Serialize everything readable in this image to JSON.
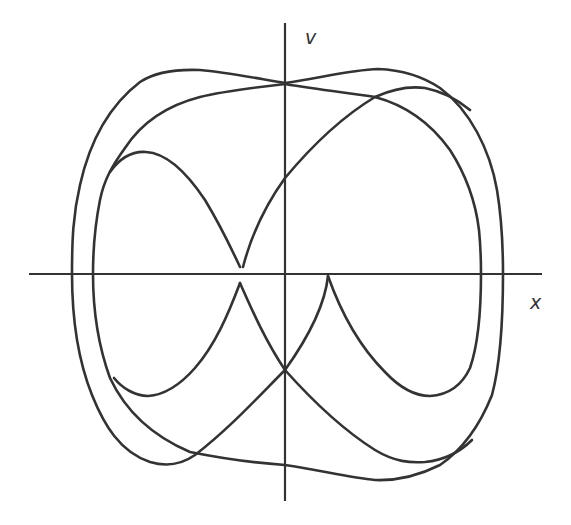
{
  "diagram": {
    "type": "phase-portrait",
    "axes": {
      "x_label": "x",
      "y_label": "v"
    },
    "colors": {
      "background": "#ffffff",
      "stroke": "#333333"
    },
    "segments": [
      "outer-top-left-lobe",
      "middle-top-left-arc",
      "inner-left-loop-upper",
      "rising-center-arc",
      "outer-top-right-lobe",
      "crossing-top-right-arc",
      "outer-bottom-left-arc",
      "middle-bottom-left-arc",
      "inner-left-loop-lower",
      "center-left-cusp-arc",
      "center-right-cusp-arc",
      "inner-right-loop",
      "lower-right-crossing-arc",
      "outer-bottom-right-arc"
    ]
  }
}
